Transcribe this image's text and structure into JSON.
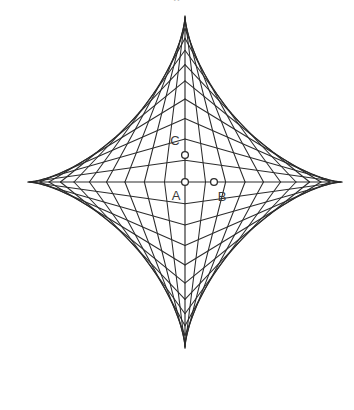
{
  "page": {
    "background_color": "#ffffff",
    "width": 354,
    "height": 410,
    "top_text_fragment": "o"
  },
  "figure": {
    "name": "astroid-envelope",
    "stroke_color": "#2b2b2b",
    "vertex_fill_color": "#ffffff",
    "label_color": "#3a3a3a",
    "center_x": 185,
    "center_y": 182,
    "radius_x": 157,
    "radius_y": 166,
    "segment_count": 12,
    "cusps": [
      {
        "name": "top-cusp",
        "x": 185,
        "y": 16
      },
      {
        "name": "right-cusp",
        "x": 342,
        "y": 182
      },
      {
        "name": "bottom-cusp",
        "x": 185,
        "y": 348
      },
      {
        "name": "left-cusp",
        "x": 28,
        "y": 182
      }
    ],
    "points": [
      {
        "id": "A",
        "label": "A",
        "x": 185,
        "y": 182,
        "label_x": 176,
        "label_y": 197,
        "role": "center-origin"
      },
      {
        "id": "B",
        "label": "B",
        "x": 214,
        "y": 182,
        "label_x": 222,
        "label_y": 198,
        "role": "horizontal-axis-node"
      },
      {
        "id": "C",
        "label": "C",
        "x": 185,
        "y": 155,
        "label_x": 175,
        "label_y": 142,
        "role": "vertical-axis-node"
      }
    ],
    "axes": [
      {
        "name": "horizontal-axis",
        "x1": 28,
        "y1": 182,
        "x2": 342,
        "y2": 182
      },
      {
        "name": "vertical-axis",
        "x1": 185,
        "y1": 16,
        "x2": 185,
        "y2": 348
      }
    ]
  },
  "chart_data": {
    "type": "line",
    "xlabel": "",
    "ylabel": "",
    "xlim": [
      -1,
      1
    ],
    "ylim": [
      -1,
      1
    ],
    "grid": false,
    "legend": null,
    "annotations": [
      {
        "text": "A",
        "x": 0.0,
        "y": 0.0
      },
      {
        "text": "B",
        "x": 0.185,
        "y": 0.0
      },
      {
        "text": "C",
        "x": 0.0,
        "y": 0.163
      }
    ],
    "series": [
      {
        "name": "astroid-curve",
        "equation": "x^(2/3) + y^(2/3) = 1",
        "points": 200
      },
      {
        "name": "sliding-segments",
        "count": 12,
        "description": "Family of unit-length segments with endpoints on the x and y axes; their envelope is the astroid."
      }
    ]
  }
}
